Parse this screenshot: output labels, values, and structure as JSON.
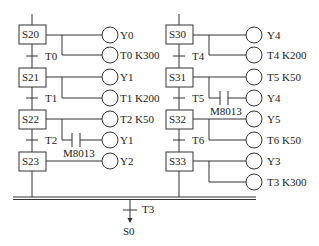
{
  "diagram": {
    "type": "SFC selective branch (PLC step ladder)",
    "left_branch": {
      "steps": [
        {
          "name": "S20",
          "outputs": [
            {
              "coil": "Y0"
            },
            {
              "coil": "T0 K300"
            }
          ],
          "transition": "T0"
        },
        {
          "name": "S21",
          "outputs": [
            {
              "coil": "Y1"
            },
            {
              "coil": "T1 K200"
            }
          ],
          "transition": "T1"
        },
        {
          "name": "S22",
          "outputs": [
            {
              "coil": "T2 K50"
            },
            {
              "coil": "Y1",
              "contact": "M8013"
            }
          ],
          "transition": "T2"
        },
        {
          "name": "S23",
          "outputs": [
            {
              "coil": "Y2"
            }
          ]
        }
      ]
    },
    "right_branch": {
      "steps": [
        {
          "name": "S30",
          "outputs": [
            {
              "coil": "Y4"
            },
            {
              "coil": "T4 K200"
            }
          ],
          "transition": "T4"
        },
        {
          "name": "S31",
          "outputs": [
            {
              "coil": "T5 K50"
            },
            {
              "coil": "Y4",
              "contact": "M8013"
            }
          ],
          "transition": "T5"
        },
        {
          "name": "S32",
          "outputs": [
            {
              "coil": "Y5"
            },
            {
              "coil": "T6 K50"
            }
          ],
          "transition": "T6"
        },
        {
          "name": "S33",
          "outputs": [
            {
              "coil": "Y3"
            },
            {
              "coil": "T3 K300"
            }
          ]
        }
      ]
    },
    "merge": {
      "transition": "T3",
      "target": "S0"
    }
  },
  "labels": {
    "S20": "S20",
    "S21": "S21",
    "S22": "S22",
    "S23": "S23",
    "S30": "S30",
    "S31": "S31",
    "S32": "S32",
    "S33": "S33",
    "T0": "T0",
    "T1": "T1",
    "T2": "T2",
    "T4": "T4",
    "T5": "T5",
    "T6": "T6",
    "T3": "T3",
    "S0": "S0",
    "c_Y0": "Y0",
    "c_T0": "T0  K300",
    "c_Y1a": "Y1",
    "c_T1": "T1  K200",
    "c_T2": "T2  K50",
    "c_Y1b": "Y1",
    "c_Y2": "Y2",
    "c_Y4a": "Y4",
    "c_T4": "T4  K200",
    "c_T5": "T5  K50",
    "c_Y4b": "Y4",
    "c_Y5": "Y5",
    "c_T6": "T6  K50",
    "c_Y3": "Y3",
    "c_T3": "T3  K300",
    "m_left": "M8013",
    "m_right": "M8013"
  }
}
